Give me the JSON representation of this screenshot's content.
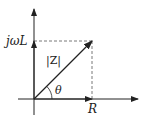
{
  "diagram": {
    "type": "impedance-phasor",
    "labels": {
      "imag_axis_value": "jωL",
      "real_axis_value": "R",
      "magnitude": "|Z|",
      "angle": "θ"
    },
    "colors": {
      "stroke": "#222222",
      "dashed": "#555555",
      "background": "#ffffff"
    }
  }
}
